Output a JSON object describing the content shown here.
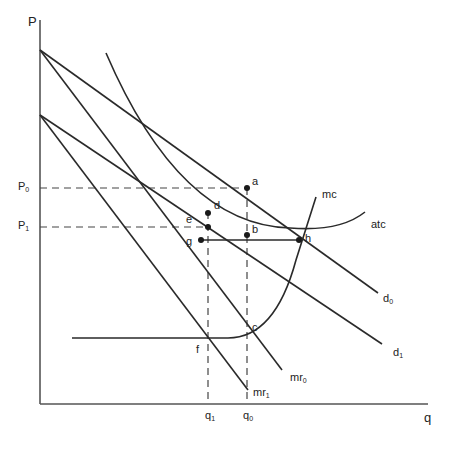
{
  "diagram": {
    "axes": {
      "y_label": "P",
      "x_label": "q"
    },
    "price_levels": [
      {
        "label": "P",
        "sub": "0"
      },
      {
        "label": "P",
        "sub": "1"
      }
    ],
    "quantity_levels": [
      {
        "label": "q",
        "sub": "1"
      },
      {
        "label": "q",
        "sub": "0"
      }
    ],
    "curves": {
      "d0": {
        "label": "d",
        "sub": "0"
      },
      "d1": {
        "label": "d",
        "sub": "1"
      },
      "mr0": {
        "label": "mr",
        "sub": "0"
      },
      "mr1": {
        "label": "mr",
        "sub": "1"
      },
      "mc": {
        "label": "mc"
      },
      "atc": {
        "label": "atc"
      }
    },
    "points": [
      "a",
      "b",
      "c",
      "d",
      "e",
      "f",
      "g",
      "h"
    ],
    "colors": {
      "line": "#2a2a2a",
      "axis": "#555555",
      "background": "#ffffff"
    }
  }
}
